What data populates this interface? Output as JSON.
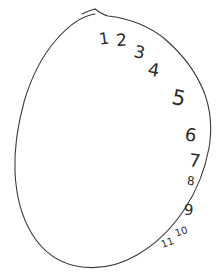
{
  "canvas": {
    "width": 220,
    "height": 277,
    "background_color": "#ffffff",
    "ink_color": "#3a3a3a",
    "numeral_color": "#2b2b2b",
    "title": "Hand-drawn closed blob outline with handwritten numbers 1 through 11"
  },
  "shape": {
    "name": "closed-blob-outline",
    "description": "Hand-drawn egg / potato shaped closed curve with a small tail hook at the top apex",
    "stroke_width": 1.1,
    "path": "M 95 9 C 99 12 103 15 108 16 C 128 18 150 26 166 40 C 182 54 196 72 204 92 C 211 110 212 130 209 148 C 205 170 196 192 184 210 C 172 228 156 244 137 255 C 118 266 96 270 76 266 C 56 262 42 250 32 234 C 21 216 16 194 15 172 C 14 148 18 124 24 102 C 31 78 42 56 56 40 C 68 26 82 16 95 14",
    "tail_path": "M 82 14 C 86 12 90 10 95 9"
  },
  "numbers": [
    {
      "label": "1",
      "x": 99,
      "y": 31,
      "size": 16,
      "rotate": -8,
      "name": "numeral-1"
    },
    {
      "label": "2",
      "x": 116,
      "y": 32,
      "size": 17,
      "rotate": -4,
      "name": "numeral-2"
    },
    {
      "label": "3",
      "x": 134,
      "y": 44,
      "size": 17,
      "rotate": 12,
      "name": "numeral-3"
    },
    {
      "label": "4",
      "x": 148,
      "y": 61,
      "size": 18,
      "rotate": 10,
      "name": "numeral-4"
    },
    {
      "label": "5",
      "x": 172,
      "y": 88,
      "size": 21,
      "rotate": 12,
      "name": "numeral-5"
    },
    {
      "label": "6",
      "x": 185,
      "y": 126,
      "size": 18,
      "rotate": 10,
      "name": "numeral-6"
    },
    {
      "label": "7",
      "x": 189,
      "y": 152,
      "size": 18,
      "rotate": 6,
      "name": "numeral-7"
    },
    {
      "label": "8",
      "x": 187,
      "y": 175,
      "size": 12,
      "rotate": 4,
      "name": "numeral-8"
    },
    {
      "label": "9",
      "x": 184,
      "y": 203,
      "size": 15,
      "rotate": 2,
      "name": "numeral-9"
    },
    {
      "label": "10",
      "x": 175,
      "y": 227,
      "size": 10,
      "rotate": -18,
      "name": "numeral-10"
    },
    {
      "label": "11",
      "x": 161,
      "y": 238,
      "size": 10,
      "rotate": -20,
      "name": "numeral-11"
    }
  ]
}
